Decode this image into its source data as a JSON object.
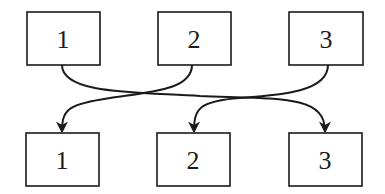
{
  "diagram": {
    "top_row": [
      {
        "label": "1"
      },
      {
        "label": "2"
      },
      {
        "label": "3"
      }
    ],
    "bottom_row": [
      {
        "label": "1"
      },
      {
        "label": "2"
      },
      {
        "label": "3"
      }
    ],
    "connections": [
      {
        "from": "top.1",
        "to": "bottom.3"
      },
      {
        "from": "top.2",
        "to": "bottom.1"
      },
      {
        "from": "top.3",
        "to": "bottom.2"
      }
    ],
    "colors": {
      "stroke": "#1a1a1a",
      "background": "#ffffff"
    }
  }
}
